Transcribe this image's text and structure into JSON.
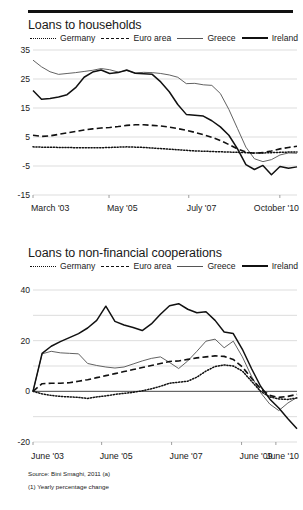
{
  "footer": {
    "source": "Source: Bini Smaghi, 2011 (a)",
    "note": "(1) Yearly percentage change"
  },
  "legend_common": [
    {
      "label": "Germany",
      "style": "dotted"
    },
    {
      "label": "Euro area",
      "style": "dashed"
    },
    {
      "label": "Greece",
      "style": "thin-solid"
    },
    {
      "label": "Ireland",
      "style": "thick-solid"
    }
  ],
  "chart_data": [
    {
      "id": "loans-to-households",
      "type": "line",
      "title": "Loans to households",
      "xlabel": "",
      "ylabel": "",
      "ylim": [
        -15,
        35
      ],
      "yticks": [
        35,
        25,
        15,
        5,
        -5,
        -15
      ],
      "ytick_labels": [
        "35",
        "25",
        "15",
        "5",
        "-5",
        "-15"
      ],
      "grid": true,
      "zero_line": true,
      "legend_position": "top",
      "x_tick_labels": [
        "March '03",
        "May '05",
        "July '07",
        "October '10"
      ],
      "x_tick_positions": [
        0,
        0.288,
        0.59,
        0.935
      ],
      "x_count": 32,
      "series": [
        {
          "name": "Germany",
          "style": "dotted",
          "values": [
            1.6,
            1.5,
            1.5,
            1.4,
            1.4,
            1.3,
            1.3,
            1.3,
            1.3,
            1.4,
            1.5,
            1.6,
            1.5,
            1.4,
            1.2,
            1.0,
            0.8,
            0.6,
            0.4,
            0.2,
            0.1,
            0.0,
            -0.1,
            -0.2,
            -0.3,
            -0.4,
            -0.5,
            -0.5,
            -0.4,
            -0.3,
            -0.2,
            -0.2
          ]
        },
        {
          "name": "Euro area",
          "style": "dashed",
          "values": [
            5.6,
            5.2,
            5.4,
            5.9,
            6.4,
            6.9,
            7.4,
            7.8,
            8.1,
            8.3,
            8.6,
            9.0,
            9.2,
            9.2,
            9.0,
            8.8,
            8.4,
            7.9,
            7.3,
            6.6,
            5.8,
            4.9,
            3.8,
            2.4,
            0.9,
            -0.2,
            -0.6,
            -0.4,
            0.2,
            0.9,
            1.4,
            1.8
          ]
        },
        {
          "name": "Greece",
          "style": "thin-solid",
          "values": [
            31.5,
            29.2,
            27.5,
            26.6,
            26.9,
            27.2,
            27.6,
            28.0,
            28.6,
            28.2,
            27.4,
            27.9,
            27.1,
            27.3,
            27.2,
            26.9,
            26.4,
            25.6,
            23.4,
            23.5,
            23.0,
            22.8,
            20.0,
            14.5,
            8.0,
            1.5,
            -2.5,
            -3.5,
            -2.8,
            -1.2,
            -0.5,
            -0.6
          ]
        },
        {
          "name": "Ireland",
          "style": "thick-solid",
          "values": [
            21.0,
            18.0,
            18.3,
            18.8,
            19.6,
            22.0,
            25.6,
            27.4,
            28.1,
            26.9,
            27.2,
            28.1,
            27.0,
            26.8,
            26.6,
            24.0,
            20.6,
            16.2,
            12.8,
            12.5,
            12.2,
            10.6,
            8.5,
            5.6,
            1.0,
            -4.5,
            -6.2,
            -4.8,
            -8.0,
            -5.2,
            -5.8,
            -5.3
          ]
        }
      ]
    },
    {
      "id": "loans-to-non-financial-cooperations",
      "type": "line",
      "title": "Loans to non-financial cooperations",
      "xlabel": "",
      "ylabel": "",
      "ylim": [
        -20,
        40
      ],
      "yticks": [
        40,
        30,
        20,
        10,
        0,
        -10,
        -20
      ],
      "ytick_labels": [
        "40",
        "",
        "20",
        "",
        "0",
        "",
        "-20"
      ],
      "grid": true,
      "zero_line": true,
      "legend_position": "top",
      "x_tick_labels": [
        "June '03",
        "June '05",
        "June '07",
        "June '09",
        "June '10"
      ],
      "x_tick_positions": [
        0,
        0.26,
        0.525,
        0.79,
        0.92
      ],
      "x_count": 30,
      "series": [
        {
          "name": "Germany",
          "style": "dotted",
          "values": [
            0.0,
            -1.0,
            -1.6,
            -2.0,
            -2.2,
            -2.4,
            -2.8,
            -2.2,
            -1.8,
            -1.2,
            -0.8,
            -0.4,
            0.2,
            1.0,
            2.0,
            3.2,
            3.6,
            4.0,
            5.6,
            8.0,
            9.8,
            10.4,
            10.0,
            8.0,
            4.0,
            0.0,
            -2.2,
            -3.0,
            -3.2,
            -2.6
          ]
        },
        {
          "name": "Euro area",
          "style": "dashed",
          "values": [
            0.0,
            3.0,
            3.2,
            3.2,
            3.4,
            4.0,
            4.6,
            5.4,
            6.2,
            7.0,
            7.8,
            8.6,
            9.4,
            10.2,
            11.0,
            11.8,
            12.0,
            12.6,
            13.2,
            13.6,
            14.0,
            13.8,
            12.6,
            9.6,
            5.2,
            1.0,
            -1.6,
            -2.4,
            -2.0,
            -1.2
          ]
        },
        {
          "name": "Greece",
          "style": "thin-solid",
          "values": [
            0.0,
            14.8,
            15.8,
            15.2,
            15.0,
            14.8,
            11.0,
            10.2,
            9.6,
            9.2,
            9.6,
            10.8,
            12.0,
            13.0,
            13.6,
            11.4,
            9.0,
            12.0,
            15.8,
            19.8,
            20.6,
            17.2,
            19.8,
            13.6,
            6.0,
            -0.5,
            -5.0,
            -7.6,
            -4.6,
            -2.4
          ]
        },
        {
          "name": "Ireland",
          "style": "thick-solid",
          "values": [
            0.0,
            15.0,
            17.8,
            19.6,
            21.2,
            22.8,
            25.0,
            28.0,
            33.6,
            27.6,
            26.2,
            25.2,
            24.0,
            26.6,
            30.4,
            33.8,
            34.6,
            32.4,
            31.0,
            31.4,
            28.0,
            23.4,
            22.8,
            16.6,
            9.0,
            2.0,
            -3.0,
            -6.6,
            -10.8,
            -14.8
          ]
        }
      ]
    }
  ]
}
